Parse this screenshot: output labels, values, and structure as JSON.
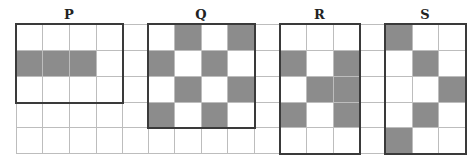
{
  "grid": {
    "origin_x": 16,
    "origin_y": 24,
    "col_edges": [
      16,
      42,
      69,
      96,
      122,
      148,
      174,
      201,
      227,
      254,
      280,
      306,
      333,
      359,
      385,
      412,
      438,
      465
    ],
    "row_edges": [
      24,
      50,
      76,
      102,
      127,
      153
    ],
    "columns": 17,
    "rows": 5,
    "line_color": "#bdbdbd",
    "shade_color": "#8c8c8c",
    "box_color": "#3a3a3a"
  },
  "figures": [
    {
      "label": "P",
      "col_start": 0,
      "col_end": 3,
      "row_start": 0,
      "row_end": 2,
      "shaded": [
        [
          1,
          0
        ],
        [
          1,
          1
        ],
        [
          1,
          2
        ]
      ]
    },
    {
      "label": "Q",
      "col_start": 5,
      "col_end": 8,
      "row_start": 0,
      "row_end": 3,
      "shaded": [
        [
          0,
          6
        ],
        [
          0,
          8
        ],
        [
          1,
          5
        ],
        [
          1,
          7
        ],
        [
          2,
          6
        ],
        [
          2,
          8
        ],
        [
          3,
          5
        ],
        [
          3,
          7
        ]
      ]
    },
    {
      "label": "R",
      "col_start": 10,
      "col_end": 12,
      "row_start": 0,
      "row_end": 4,
      "shaded": [
        [
          1,
          10
        ],
        [
          1,
          12
        ],
        [
          2,
          11
        ],
        [
          2,
          12
        ],
        [
          3,
          10
        ],
        [
          3,
          12
        ]
      ]
    },
    {
      "label": "S",
      "col_start": 14,
      "col_end": 16,
      "row_start": 0,
      "row_end": 4,
      "shaded": [
        [
          0,
          14
        ],
        [
          1,
          15
        ],
        [
          2,
          16
        ],
        [
          3,
          15
        ],
        [
          4,
          14
        ]
      ]
    }
  ]
}
